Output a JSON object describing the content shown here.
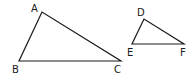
{
  "diagram": {
    "type": "similar-triangles",
    "stroke_color": "#1a1a1a",
    "triangles": [
      {
        "name": "ABC",
        "vertices": [
          {
            "label": "A",
            "x": 42,
            "y": 12,
            "lx": 31,
            "ly": 12
          },
          {
            "label": "B",
            "x": 19,
            "y": 61,
            "lx": 12,
            "ly": 73
          },
          {
            "label": "C",
            "x": 121,
            "y": 61,
            "lx": 114,
            "ly": 73
          }
        ]
      },
      {
        "name": "DEF",
        "vertices": [
          {
            "label": "D",
            "x": 144,
            "y": 19,
            "lx": 137,
            "ly": 16
          },
          {
            "label": "E",
            "x": 132,
            "y": 44,
            "lx": 127,
            "ly": 56
          },
          {
            "label": "F",
            "x": 184,
            "y": 44,
            "lx": 180,
            "ly": 56
          }
        ]
      }
    ]
  }
}
